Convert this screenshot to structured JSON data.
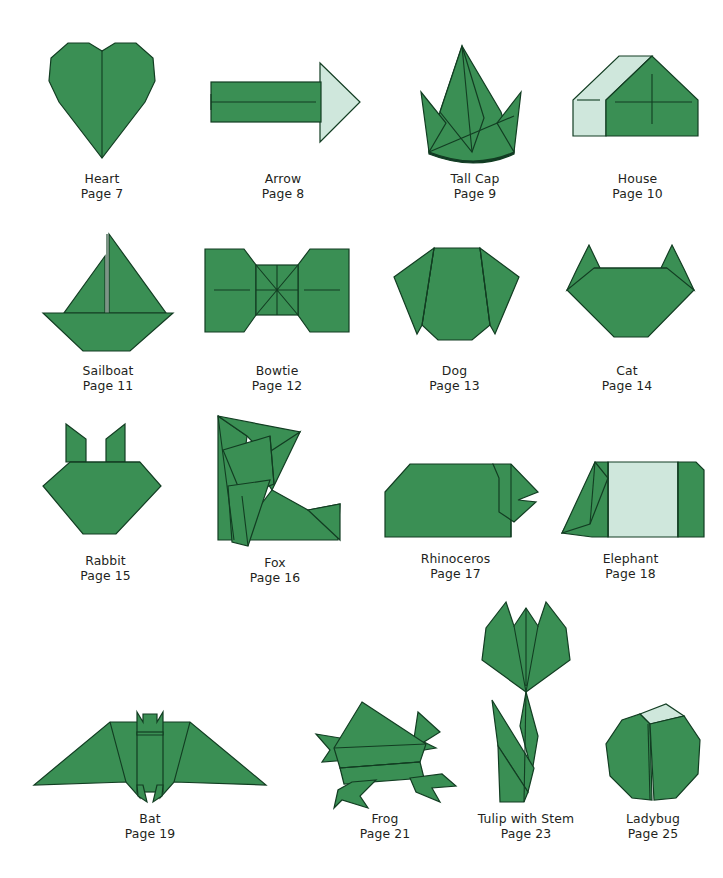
{
  "page": {
    "background_color": "#ffffff",
    "text_color": "#231f20"
  },
  "palette": {
    "green": "#3a8f54",
    "green_dark": "#2f7a46",
    "pale_green": "#cfe7dc",
    "outline": "#123d22",
    "shadow_dark": "#123a28"
  },
  "labels": {
    "page_word": "Page"
  },
  "models": [
    {
      "id": "heart",
      "name": "Heart",
      "page": "Page 7",
      "page_number": 7,
      "row": 1,
      "column": 1,
      "icon": "heart-origami"
    },
    {
      "id": "arrow",
      "name": "Arrow",
      "page": "Page 8",
      "page_number": 8,
      "row": 1,
      "column": 2,
      "icon": "arrow-origami"
    },
    {
      "id": "tall-cap",
      "name": "Tall Cap",
      "page": "Page 9",
      "page_number": 9,
      "row": 1,
      "column": 3,
      "icon": "tall-cap-origami"
    },
    {
      "id": "house",
      "name": "House",
      "page": "Page 10",
      "page_number": 10,
      "row": 1,
      "column": 4,
      "icon": "house-origami"
    },
    {
      "id": "sailboat",
      "name": "Sailboat",
      "page": "Page 11",
      "page_number": 11,
      "row": 2,
      "column": 1,
      "icon": "sailboat-origami"
    },
    {
      "id": "bowtie",
      "name": "Bowtie",
      "page": "Page 12",
      "page_number": 12,
      "row": 2,
      "column": 2,
      "icon": "bowtie-origami"
    },
    {
      "id": "dog",
      "name": "Dog",
      "page": "Page 13",
      "page_number": 13,
      "row": 2,
      "column": 3,
      "icon": "dog-origami"
    },
    {
      "id": "cat",
      "name": "Cat",
      "page": "Page 14",
      "page_number": 14,
      "row": 2,
      "column": 4,
      "icon": "cat-origami"
    },
    {
      "id": "rabbit",
      "name": "Rabbit",
      "page": "Page 15",
      "page_number": 15,
      "row": 3,
      "column": 1,
      "icon": "rabbit-origami"
    },
    {
      "id": "fox",
      "name": "Fox",
      "page": "Page 16",
      "page_number": 16,
      "row": 3,
      "column": 2,
      "icon": "fox-origami"
    },
    {
      "id": "rhinoceros",
      "name": "Rhinoceros",
      "page": "Page 17",
      "page_number": 17,
      "row": 3,
      "column": 3,
      "icon": "rhinoceros-origami"
    },
    {
      "id": "elephant",
      "name": "Elephant",
      "page": "Page 18",
      "page_number": 18,
      "row": 3,
      "column": 4,
      "icon": "elephant-origami"
    },
    {
      "id": "bat",
      "name": "Bat",
      "page": "Page 19",
      "page_number": 19,
      "row": 4,
      "column": 1,
      "icon": "bat-origami"
    },
    {
      "id": "frog",
      "name": "Frog",
      "page": "Page 21",
      "page_number": 21,
      "row": 4,
      "column": 2,
      "icon": "frog-origami"
    },
    {
      "id": "tulip-with-stem",
      "name": "Tulip with Stem",
      "page": "Page 23",
      "page_number": 23,
      "row": 4,
      "column": 3,
      "icon": "tulip-origami"
    },
    {
      "id": "ladybug",
      "name": "Ladybug",
      "page": "Page 25",
      "page_number": 25,
      "row": 4,
      "column": 4,
      "icon": "ladybug-origami"
    }
  ]
}
